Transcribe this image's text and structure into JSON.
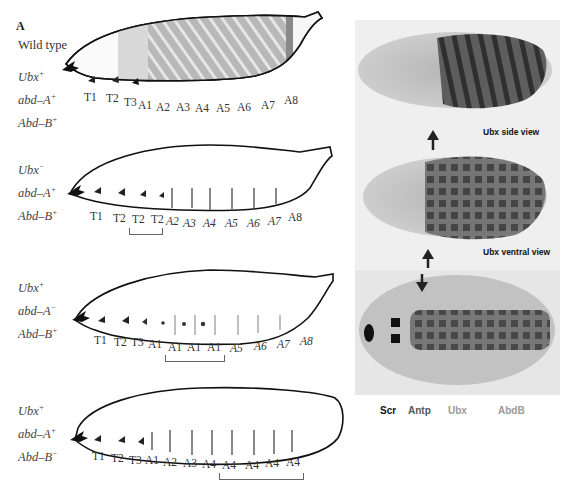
{
  "panel_a": {
    "letter": "A",
    "rows": [
      {
        "label": "Wild type",
        "genotype": [
          {
            "gene": "Ubx",
            "allele": "+"
          },
          {
            "gene": "abd–A",
            "allele": "+"
          },
          {
            "gene": "Abd–B",
            "allele": "+"
          }
        ],
        "segments": [
          "T1",
          "T2",
          "T3",
          "A1",
          "A2",
          "A3",
          "A4",
          "A5",
          "A6",
          "A7",
          "A8"
        ],
        "bracket": null
      },
      {
        "label": "",
        "genotype": [
          {
            "gene": "Ubx",
            "allele": "−"
          },
          {
            "gene": "abd–A",
            "allele": "+"
          },
          {
            "gene": "Abd–B",
            "allele": "+"
          }
        ],
        "segments": [
          "T1",
          "T2",
          "T2",
          "T2",
          "A2",
          "A3",
          "A4",
          "A5",
          "A6",
          "A7",
          "A8"
        ],
        "bracket": "T2–T2 (transformed A1 region)"
      },
      {
        "label": "",
        "genotype": [
          {
            "gene": "Ubx",
            "allele": "+"
          },
          {
            "gene": "abd–A",
            "allele": "−"
          },
          {
            "gene": "Abd–B",
            "allele": "+"
          }
        ],
        "segments": [
          "T1",
          "T2",
          "T3",
          "A1",
          "A1",
          "A1",
          "A1",
          "A5",
          "A6",
          "A7",
          "A8"
        ],
        "bracket": "A1 A1 A1"
      },
      {
        "label": "",
        "genotype": [
          {
            "gene": "Ubx",
            "allele": "+"
          },
          {
            "gene": "abd–A",
            "allele": "+"
          },
          {
            "gene": "Abd–B",
            "allele": "−"
          }
        ],
        "segments": [
          "T1",
          "T2",
          "T3",
          "A1",
          "A2",
          "A3",
          "A4",
          "A4",
          "A4",
          "A4",
          "A4"
        ],
        "bracket": "A4 A4 A4 A4"
      }
    ]
  },
  "panel_b": {
    "letter": "B",
    "views": [
      {
        "label": "Ubx side view"
      },
      {
        "label": "Ubx ventral view"
      },
      {
        "label": ""
      }
    ],
    "legend": [
      {
        "label": "Scr",
        "color": "#111111"
      },
      {
        "label": "Antp",
        "color": "#555555"
      },
      {
        "label": "Ubx",
        "color": "#9a9a9a"
      },
      {
        "label": "AbdB",
        "color": "#9a9a9a"
      }
    ]
  }
}
